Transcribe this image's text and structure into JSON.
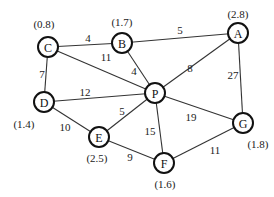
{
  "graph": {
    "nodes": [
      {
        "id": "A",
        "label": "A",
        "heuristic": "(2.8)"
      },
      {
        "id": "B",
        "label": "B",
        "heuristic": "(1.7)"
      },
      {
        "id": "C",
        "label": "C",
        "heuristic": "(0.8)"
      },
      {
        "id": "D",
        "label": "D",
        "heuristic": "(1.4)"
      },
      {
        "id": "E",
        "label": "E",
        "heuristic": "(2.5)"
      },
      {
        "id": "F",
        "label": "F",
        "heuristic": "(1.6)"
      },
      {
        "id": "G",
        "label": "G",
        "heuristic": "(1.8)"
      },
      {
        "id": "P",
        "label": "P",
        "heuristic": ""
      }
    ],
    "edges": [
      {
        "from": "C",
        "to": "B",
        "weight": "4"
      },
      {
        "from": "B",
        "to": "A",
        "weight": "5"
      },
      {
        "from": "C",
        "to": "P",
        "weight": "11"
      },
      {
        "from": "B",
        "to": "P",
        "weight": "4"
      },
      {
        "from": "A",
        "to": "P",
        "weight": "8"
      },
      {
        "from": "A",
        "to": "G",
        "weight": "27"
      },
      {
        "from": "C",
        "to": "D",
        "weight": "7"
      },
      {
        "from": "D",
        "to": "P",
        "weight": "12"
      },
      {
        "from": "D",
        "to": "E",
        "weight": "10"
      },
      {
        "from": "E",
        "to": "P",
        "weight": "5"
      },
      {
        "from": "P",
        "to": "F",
        "weight": "15"
      },
      {
        "from": "P",
        "to": "G",
        "weight": "19"
      },
      {
        "from": "E",
        "to": "F",
        "weight": "9"
      },
      {
        "from": "F",
        "to": "G",
        "weight": "11"
      }
    ]
  }
}
